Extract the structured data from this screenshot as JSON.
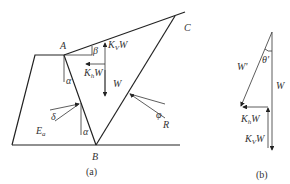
{
  "figure_a": {
    "caption": "(a)",
    "points": {
      "A": "A",
      "B": "B",
      "C": "C"
    },
    "angles": {
      "alpha_top": "α",
      "alpha_bottom": "α",
      "beta": "β",
      "delta": "δ",
      "phi": "φ"
    },
    "forces": {
      "kv": "K",
      "kv_sub": "V",
      "kv_w": "W",
      "kh": "K",
      "kh_sub": "h",
      "kh_w": "W",
      "w": "W",
      "ea": "E",
      "ea_sub": "a",
      "r": "R"
    }
  },
  "figure_b": {
    "caption": "(b)",
    "angles": {
      "theta": "θ'"
    },
    "forces": {
      "w_prime": "W'",
      "w": "W",
      "kh": "K",
      "kh_sub": "h",
      "kh_w": "W",
      "kv": "K",
      "kv_sub": "V",
      "kv_w": "W"
    }
  }
}
